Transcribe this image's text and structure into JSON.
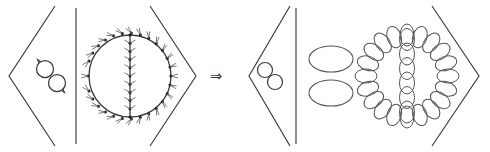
{
  "figure": {
    "background_color": "#ffffff",
    "stroke_color": "#3a3a3a",
    "light_stroke_color": "#666666",
    "vertex_color": "#1a1a1a",
    "width": 490,
    "height": 152
  },
  "relation": {
    "symbol": "⇒",
    "name": "implies-arrow",
    "x": 216,
    "y": 76
  },
  "expressions": [
    {
      "id": "left-expression",
      "name": "left-bracket-expression",
      "open_bracket": "⟨",
      "close_bracket": "⟩",
      "bracket_left_x": 8,
      "bracket_right_x": 196,
      "separators": [
        {
          "name": "vertical-bar-separator",
          "x": 76,
          "label": "|"
        }
      ],
      "terms": [
        {
          "id": "left-term-1",
          "name": "double-circle-directed-graph",
          "kind": "two-tangent-circles-with-arrows",
          "label": "∞",
          "center_x": 51,
          "center_y": 76,
          "circles": [
            {
              "cx": 45,
              "cy": 69,
              "r": 8.5,
              "arrow": true
            },
            {
              "cx": 57,
              "cy": 83,
              "r": 8.5,
              "arrow": true
            }
          ]
        },
        {
          "id": "left-term-2",
          "name": "theta-graph-directed",
          "kind": "circle-with-diameter-arrows-and-vertices",
          "center_x": 130,
          "center_y": 76,
          "radius": 41,
          "boundary_vertices": 28,
          "diameter_vertices": 11,
          "has_vertical_diameter": true,
          "arrow_marks": true
        }
      ]
    },
    {
      "id": "right-expression",
      "name": "right-bracket-expression",
      "open_bracket": "⟨",
      "close_bracket": "⟩",
      "bracket_left_x": 248,
      "bracket_right_x": 478,
      "separators": [
        {
          "name": "vertical-bar-separator",
          "x": 296,
          "label": "|"
        }
      ],
      "terms": [
        {
          "id": "right-term-1",
          "name": "double-circle-plain-graph",
          "kind": "two-tangent-circles",
          "center_x": 270,
          "center_y": 76,
          "circles": [
            {
              "cx": 265,
              "cy": 70,
              "r": 7.5,
              "arrow": false
            },
            {
              "cx": 275,
              "cy": 82,
              "r": 7.5,
              "arrow": false
            }
          ]
        },
        {
          "id": "right-term-2",
          "name": "stacked-ellipse-pair",
          "kind": "two-horizontal-ellipses",
          "center_x": 331,
          "center_y": 76,
          "ellipses": [
            {
              "cx": 331,
              "cy": 59,
              "rx": 22,
              "ry": 13
            },
            {
              "cx": 331,
              "cy": 93,
              "rx": 22,
              "ry": 13
            }
          ]
        },
        {
          "id": "right-term-3",
          "name": "theta-graph-thickened",
          "kind": "circle-with-diameter-made-of-ellipse-chain",
          "center_x": 407,
          "center_y": 76,
          "radius": 41,
          "boundary_beads": 20,
          "diameter_beads": 6,
          "bead_rx": 7,
          "bead_ry": 11,
          "has_vertical_diameter": true
        }
      ]
    }
  ]
}
